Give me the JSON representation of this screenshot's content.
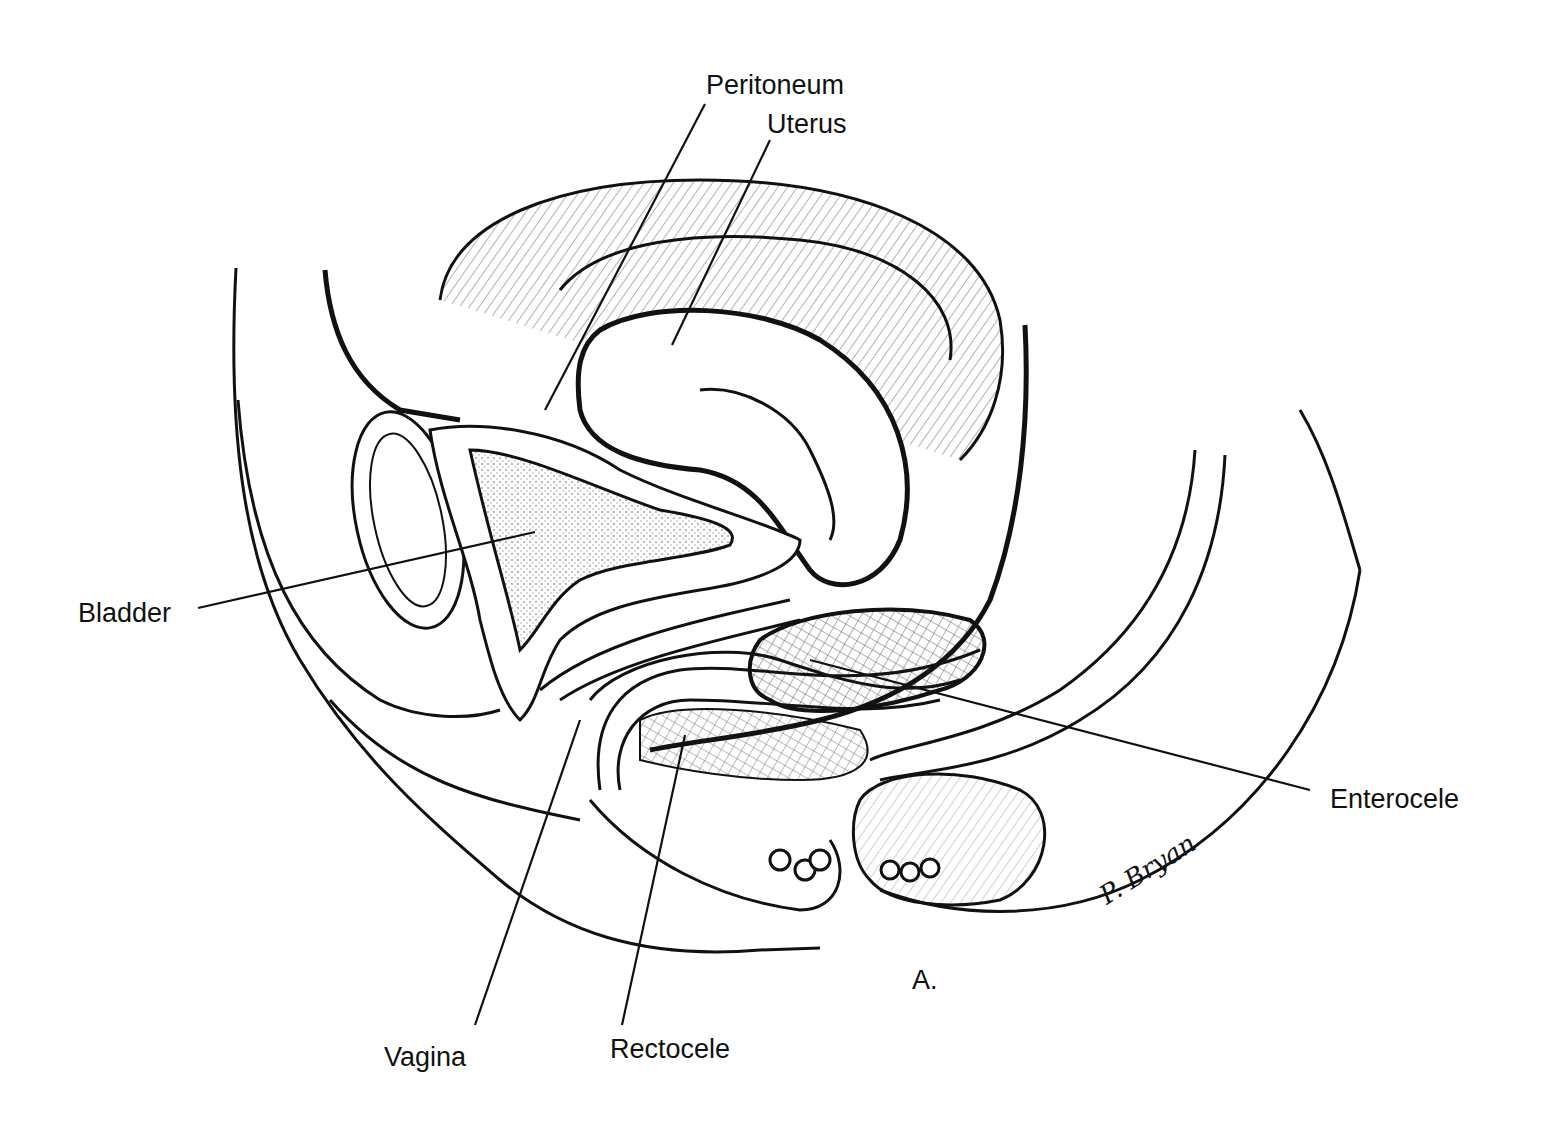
{
  "figure": {
    "panel_label": "A.",
    "signature": "P. Bryan",
    "labels": {
      "peritoneum": "Peritoneum",
      "uterus": "Uterus",
      "bladder": "Bladder",
      "enterocele": "Enterocele",
      "vagina": "Vagina",
      "rectocele": "Rectocele"
    }
  }
}
